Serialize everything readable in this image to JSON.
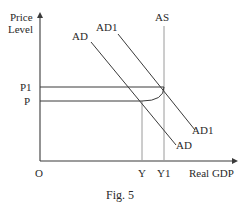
{
  "figure": {
    "caption": "Fig. 5",
    "y_axis_label_line1": "Price",
    "y_axis_label_line2": "Level",
    "x_axis_label": "Real GDP",
    "origin_label": "O",
    "price_levels": [
      "P1",
      "P"
    ],
    "output_levels": [
      "Y",
      "Y1"
    ],
    "curves": {
      "as": "AS",
      "ad_top": "AD",
      "ad1_top": "AD1",
      "ad_bottom": "AD",
      "ad1_bottom": "AD1"
    },
    "colors": {
      "axis": "#3a3a3a",
      "curve": "#3a3a3a",
      "guide": "#9a9a9a",
      "text": "#2a2a2a"
    }
  }
}
